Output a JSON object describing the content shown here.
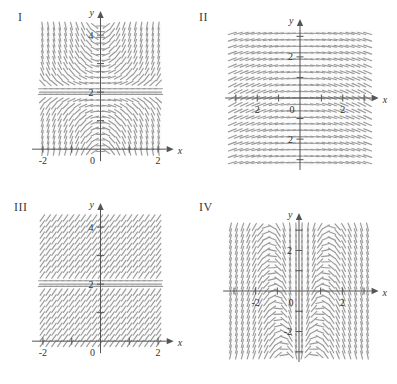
{
  "figure": {
    "type": "multi-panel-direction-field",
    "panel_count": 4,
    "background_color": "#ffffff",
    "dash_color": "#9a9a9a",
    "axis_color": "#555555",
    "label_color": "#333333"
  },
  "panels": [
    {
      "id": "I",
      "label": "I",
      "axis_x_name": "x",
      "axis_y_name": "y",
      "x_ticks": [
        -2,
        -1,
        1,
        2
      ],
      "x_tick_labels": [
        "-2",
        "",
        "",
        "2"
      ],
      "x_origin_label": "0",
      "y_ticks": [
        1,
        2,
        3,
        4
      ],
      "y_tick_labels": [
        "",
        "2",
        "",
        "4"
      ],
      "xlim": [
        -2.45,
        2.45
      ],
      "ylim": [
        -0.45,
        4.6
      ],
      "equilibrium_line_y": 2,
      "description": "direction field with horizontal equilibrium at y=2, slopes steep away from y=2"
    },
    {
      "id": "II",
      "label": "II",
      "axis_x_name": "x",
      "axis_y_name": "y",
      "x_ticks": [
        -3,
        -2,
        -1,
        1,
        2,
        3
      ],
      "x_tick_labels": [
        "",
        "2",
        "",
        "",
        "2",
        ""
      ],
      "x_origin_label": "0",
      "y_ticks": [
        -3,
        -2,
        -1,
        1,
        2,
        3
      ],
      "y_tick_labels": [
        "",
        "2",
        "",
        "",
        "2",
        ""
      ],
      "xlim": [
        -3.6,
        3.6
      ],
      "ylim": [
        -3.6,
        3.6
      ],
      "equilibrium_line_y": null,
      "description": "nearly horizontal slope field, dashes dip toward the y-axis"
    },
    {
      "id": "III",
      "label": "III",
      "axis_x_name": "x",
      "axis_y_name": "y",
      "x_ticks": [
        -2,
        -1,
        1,
        2
      ],
      "x_tick_labels": [
        "-2",
        "",
        "",
        "2"
      ],
      "x_origin_label": "0",
      "y_ticks": [
        1,
        2,
        3,
        4
      ],
      "y_tick_labels": [
        "",
        "2",
        "",
        "4"
      ],
      "xlim": [
        -2.45,
        2.45
      ],
      "ylim": [
        -0.45,
        4.6
      ],
      "equilibrium_line_y": 2,
      "description": "uniformly tilted slope field with horizontal equilibrium at y=2"
    },
    {
      "id": "IV",
      "label": "IV",
      "axis_x_name": "x",
      "axis_y_name": "y",
      "x_ticks": [
        -3,
        -2,
        -1,
        1,
        2,
        3
      ],
      "x_tick_labels": [
        "",
        "-2",
        "",
        "",
        "2",
        ""
      ],
      "x_origin_label": "0",
      "y_ticks": [
        -3,
        -2,
        -1,
        1,
        2,
        3
      ],
      "y_tick_labels": [
        "",
        "-2",
        "",
        "",
        "2",
        ""
      ],
      "xlim": [
        -3.6,
        3.6
      ],
      "ylim": [
        -3.6,
        3.6
      ],
      "equilibrium_line_y": null,
      "description": "saddle-like direction field centered at the origin, steep near the y-axis"
    }
  ],
  "chart_data": {
    "type": "scatter",
    "title": "",
    "xlabel": "x",
    "ylabel": "y",
    "grid": false,
    "legend": "none",
    "fields": [
      {
        "panel": "I",
        "slope_rule": "dy/dx proportional to (y-2), magnitude grows with |x| and |y-2|",
        "xlim": [
          -2.45,
          2.45
        ],
        "ylim": [
          -0.45,
          4.6
        ],
        "sample_slopes": [
          {
            "x": -2,
            "y": 4,
            "angle_deg": 72
          },
          {
            "x": -1,
            "y": 4,
            "angle_deg": 60
          },
          {
            "x": 0,
            "y": 4,
            "angle_deg": 0
          },
          {
            "x": 1,
            "y": 4,
            "angle_deg": -60
          },
          {
            "x": 2,
            "y": 4,
            "angle_deg": -72
          },
          {
            "x": -2,
            "y": 3,
            "angle_deg": 60
          },
          {
            "x": 0,
            "y": 3,
            "angle_deg": 0
          },
          {
            "x": 2,
            "y": 3,
            "angle_deg": -60
          },
          {
            "x": -2,
            "y": 2,
            "angle_deg": 0
          },
          {
            "x": 0,
            "y": 2,
            "angle_deg": 0
          },
          {
            "x": 2,
            "y": 2,
            "angle_deg": 0
          },
          {
            "x": -2,
            "y": 1,
            "angle_deg": -60
          },
          {
            "x": 0,
            "y": 1,
            "angle_deg": 0
          },
          {
            "x": 2,
            "y": 1,
            "angle_deg": 60
          },
          {
            "x": -2,
            "y": 0,
            "angle_deg": -72
          },
          {
            "x": 0,
            "y": 0,
            "angle_deg": 0
          },
          {
            "x": 2,
            "y": 0,
            "angle_deg": 72
          }
        ]
      },
      {
        "panel": "II",
        "slope_rule": "shallow slopes, sign follows -x, magnitude shrinks far from axes",
        "xlim": [
          -3.6,
          3.6
        ],
        "ylim": [
          -3.6,
          3.6
        ],
        "sample_slopes": [
          {
            "x": -3,
            "y": 3,
            "angle_deg": 4
          },
          {
            "x": -1,
            "y": 2,
            "angle_deg": 18
          },
          {
            "x": 0,
            "y": 2,
            "angle_deg": 0
          },
          {
            "x": 1,
            "y": 2,
            "angle_deg": -18
          },
          {
            "x": 3,
            "y": 3,
            "angle_deg": -4
          },
          {
            "x": -1,
            "y": 0,
            "angle_deg": 6
          },
          {
            "x": 1,
            "y": 0,
            "angle_deg": -6
          },
          {
            "x": -1,
            "y": -2,
            "angle_deg": -18
          },
          {
            "x": 1,
            "y": -2,
            "angle_deg": 18
          },
          {
            "x": -3,
            "y": -3,
            "angle_deg": -4
          },
          {
            "x": 3,
            "y": -3,
            "angle_deg": 4
          }
        ]
      },
      {
        "panel": "III",
        "slope_rule": "constant positive tilt except the equilibrium line y=2",
        "xlim": [
          -2.45,
          2.45
        ],
        "ylim": [
          -0.45,
          4.6
        ],
        "sample_slopes": [
          {
            "x": -2,
            "y": 4,
            "angle_deg": 55
          },
          {
            "x": 0,
            "y": 4,
            "angle_deg": 55
          },
          {
            "x": 2,
            "y": 4,
            "angle_deg": 55
          },
          {
            "x": -2,
            "y": 2,
            "angle_deg": 0
          },
          {
            "x": 0,
            "y": 2,
            "angle_deg": 0
          },
          {
            "x": 2,
            "y": 2,
            "angle_deg": 0
          },
          {
            "x": -2,
            "y": 0,
            "angle_deg": 55
          },
          {
            "x": 0,
            "y": 0,
            "angle_deg": 55
          },
          {
            "x": 2,
            "y": 0,
            "angle_deg": 55
          }
        ]
      },
      {
        "panel": "IV",
        "slope_rule": "saddle pattern, steep vertical near x=0, flattening along diagonals",
        "xlim": [
          -3.6,
          3.6
        ],
        "ylim": [
          -3.6,
          3.6
        ],
        "sample_slopes": [
          {
            "x": -3,
            "y": 3,
            "angle_deg": 8
          },
          {
            "x": -1,
            "y": 3,
            "angle_deg": 70
          },
          {
            "x": 0,
            "y": 3,
            "angle_deg": 88
          },
          {
            "x": 1,
            "y": 3,
            "angle_deg": 80
          },
          {
            "x": 3,
            "y": 3,
            "angle_deg": 78
          },
          {
            "x": -3,
            "y": 0,
            "angle_deg": 84
          },
          {
            "x": -1,
            "y": 0,
            "angle_deg": 86
          },
          {
            "x": 1,
            "y": 0,
            "angle_deg": -70
          },
          {
            "x": 3,
            "y": 0,
            "angle_deg": -20
          },
          {
            "x": -3,
            "y": -3,
            "angle_deg": 80
          },
          {
            "x": -1,
            "y": -3,
            "angle_deg": 86
          },
          {
            "x": 1,
            "y": -3,
            "angle_deg": -78
          },
          {
            "x": 3,
            "y": -3,
            "angle_deg": -10
          }
        ]
      }
    ]
  }
}
